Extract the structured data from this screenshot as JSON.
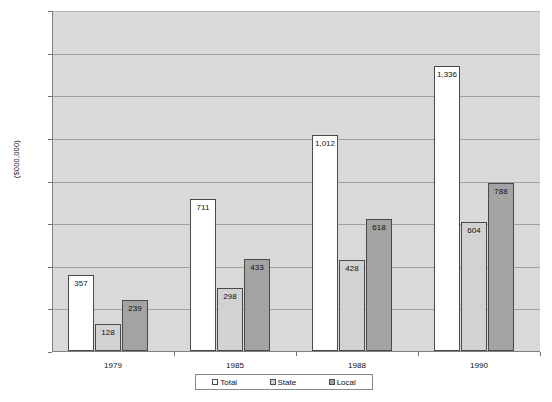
{
  "chart_data": {
    "type": "bar",
    "title": "",
    "xlabel": "",
    "ylabel": "($000,000)",
    "categories": [
      "1979",
      "1985",
      "1988",
      "1990"
    ],
    "series": [
      {
        "name": "Total",
        "color": "#ffffff",
        "values": [
          357,
          711,
          1012,
          1336
        ],
        "labels": [
          "357",
          "711",
          "1,012",
          "1,336"
        ]
      },
      {
        "name": "State",
        "color": "#d2d2d2",
        "values": [
          128,
          298,
          428,
          604
        ],
        "labels": [
          "128",
          "298",
          "428",
          "604"
        ]
      },
      {
        "name": "Local",
        "color": "#a3a3a3",
        "values": [
          239,
          433,
          618,
          788
        ],
        "labels": [
          "239",
          "433",
          "618",
          "788"
        ]
      }
    ],
    "ylim": [
      0,
      1600
    ],
    "yticks": [
      0,
      200,
      400,
      600,
      800,
      1000,
      1200,
      1400,
      1600
    ],
    "ytick_labels": [
      "0",
      "200",
      "400",
      "600",
      "800",
      "1000",
      "1200",
      "1400",
      "1600"
    ],
    "grid": true,
    "legend_position": "bottom",
    "plot_background": "#d9d9d9"
  },
  "legend": {
    "items": [
      {
        "label": "Total"
      },
      {
        "label": "State"
      },
      {
        "label": "Local"
      }
    ]
  }
}
